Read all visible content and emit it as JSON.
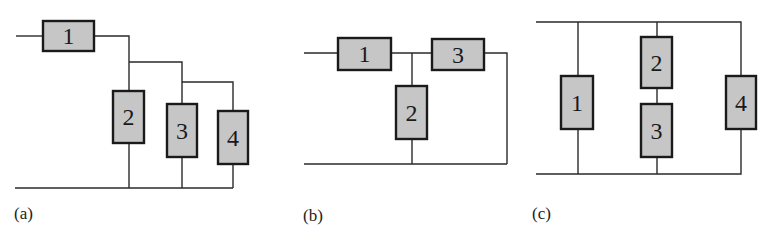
{
  "figure": {
    "colors": {
      "box_fill": "#c6c6c6",
      "box_stroke": "#1a1a1a",
      "wire": "#2a2a2a"
    },
    "panels": [
      {
        "id": "a",
        "label": "(a)",
        "description": "Component 1 in series with parallel combination of components 2, 3, 4",
        "components": [
          {
            "id": "1",
            "label": "1",
            "orientation": "horizontal"
          },
          {
            "id": "2",
            "label": "2",
            "orientation": "vertical"
          },
          {
            "id": "3",
            "label": "3",
            "orientation": "vertical"
          },
          {
            "id": "4",
            "label": "4",
            "orientation": "vertical"
          }
        ]
      },
      {
        "id": "b",
        "label": "(b)",
        "description": "Component 1 in series with parallel combination of component 2 and component 3",
        "components": [
          {
            "id": "1",
            "label": "1",
            "orientation": "horizontal"
          },
          {
            "id": "2",
            "label": "2",
            "orientation": "vertical"
          },
          {
            "id": "3",
            "label": "3",
            "orientation": "horizontal"
          }
        ]
      },
      {
        "id": "c",
        "label": "(c)",
        "description": "Component 1, series pair 2-3, and component 4 all in parallel",
        "components": [
          {
            "id": "1",
            "label": "1",
            "orientation": "vertical"
          },
          {
            "id": "2",
            "label": "2",
            "orientation": "vertical"
          },
          {
            "id": "3",
            "label": "3",
            "orientation": "vertical"
          },
          {
            "id": "4",
            "label": "4",
            "orientation": "vertical"
          }
        ]
      }
    ]
  }
}
